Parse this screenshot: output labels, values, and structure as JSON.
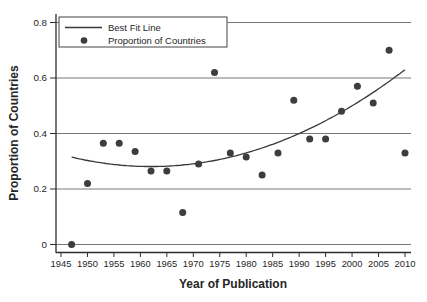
{
  "figure": {
    "background": "#ffffff"
  },
  "chart_data": {
    "type": "scatter",
    "title": "",
    "xlabel": "Year of Publication",
    "ylabel": "Proportion of Countries",
    "xlim": [
      1944,
      2011
    ],
    "ylim": [
      0,
      0.8
    ],
    "grid": "horizontal",
    "x_ticks": [
      1945,
      1950,
      1955,
      1960,
      1965,
      1970,
      1975,
      1980,
      1985,
      1990,
      1995,
      2000,
      2005,
      2010
    ],
    "y_ticks": [
      0,
      0.2,
      0.4,
      0.6,
      0.8
    ],
    "y_tick_labels": [
      "0",
      "0.2",
      "0.4",
      "0.6",
      "0.8"
    ],
    "legend": {
      "position": "top-left",
      "entries": [
        {
          "label": "Best Fit Line",
          "marker": "line"
        },
        {
          "label": "Proportion of Countries",
          "marker": "dot"
        }
      ]
    },
    "series": [
      {
        "name": "Proportion of Countries",
        "type": "scatter",
        "points": [
          [
            1947,
            0.0
          ],
          [
            1950,
            0.22
          ],
          [
            1953,
            0.365
          ],
          [
            1956,
            0.365
          ],
          [
            1959,
            0.335
          ],
          [
            1962,
            0.265
          ],
          [
            1965,
            0.265
          ],
          [
            1968,
            0.115
          ],
          [
            1971,
            0.29
          ],
          [
            1974,
            0.62
          ],
          [
            1977,
            0.33
          ],
          [
            1980,
            0.315
          ],
          [
            1983,
            0.25
          ],
          [
            1986,
            0.33
          ],
          [
            1989,
            0.52
          ],
          [
            1992,
            0.38
          ],
          [
            1995,
            0.38
          ],
          [
            1998,
            0.48
          ],
          [
            2001,
            0.57
          ],
          [
            2004,
            0.51
          ],
          [
            2007,
            0.7
          ],
          [
            2010,
            0.33
          ]
        ]
      },
      {
        "name": "Best Fit Line",
        "type": "quadratic",
        "vertex_year": 1962,
        "vertex_value": 0.281,
        "coefficient": 0.0001515,
        "year_start": 1947,
        "year_end": 2010
      }
    ],
    "colors": {
      "point": "#3d3d3d",
      "line": "#3a3a3a",
      "grid": "#555555",
      "axis": "#2f2f2f",
      "text": "#262626",
      "legend_border": "#444444",
      "background": "#ffffff"
    }
  }
}
